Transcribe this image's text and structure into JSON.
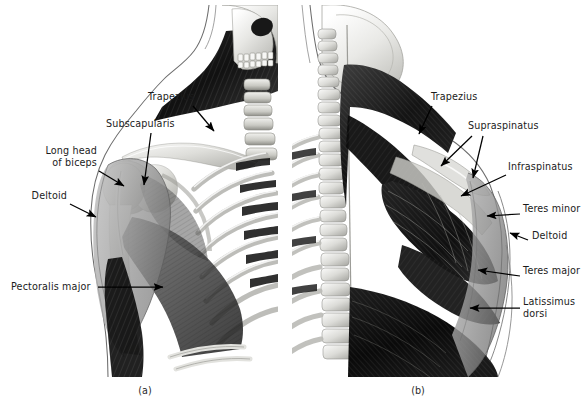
{
  "figure": {
    "background": "#ffffff",
    "text_color": "#1b1b1b",
    "leader_color": "#000000"
  },
  "panels": [
    {
      "id": "a",
      "caption": "(a)",
      "view": "anterior",
      "labels": [
        {
          "name": "trapezius",
          "text": "Trapezius",
          "lines": [
            "Trapezius"
          ],
          "align": "left",
          "x": 148,
          "y": 96
        },
        {
          "name": "subscapularis",
          "text": "Subscapularis",
          "lines": [
            "Subscapularis"
          ],
          "align": "left",
          "x": 106,
          "y": 123
        },
        {
          "name": "long-head-biceps",
          "text": "Long head of biceps",
          "lines": [
            "Long head",
            "of biceps"
          ],
          "align": "right",
          "x": 96,
          "y": 149
        },
        {
          "name": "deltoid",
          "text": "Deltoid",
          "lines": [
            "Deltoid"
          ],
          "align": "right",
          "x": 62,
          "y": 194
        },
        {
          "name": "pectoralis-major",
          "text": "Pectoralis major",
          "lines": [
            "Pectoralis major"
          ],
          "align": "left",
          "x": 11,
          "y": 281
        }
      ]
    },
    {
      "id": "b",
      "caption": "(b)",
      "view": "posterior",
      "labels": [
        {
          "name": "trapezius",
          "text": "Trapezius",
          "lines": [
            "Trapezius"
          ],
          "align": "left",
          "x": 432,
          "y": 96
        },
        {
          "name": "supraspinatus",
          "text": "Supraspinatus",
          "lines": [
            "Supraspinatus"
          ],
          "align": "left",
          "x": 469,
          "y": 124
        },
        {
          "name": "infraspinatus",
          "text": "Infraspinatus",
          "lines": [
            "Infraspinatus"
          ],
          "align": "left",
          "x": 509,
          "y": 166
        },
        {
          "name": "teres-minor",
          "text": "Teres minor",
          "lines": [
            "Teres minor"
          ],
          "align": "left",
          "x": 524,
          "y": 208
        },
        {
          "name": "deltoid",
          "text": "Deltoid",
          "lines": [
            "Deltoid"
          ],
          "align": "left",
          "x": 532,
          "y": 235
        },
        {
          "name": "teres-major",
          "text": "Teres major",
          "lines": [
            "Teres major"
          ],
          "align": "left",
          "x": 524,
          "y": 269
        },
        {
          "name": "latissimus-dorsi",
          "text": "Latissimus dorsi",
          "lines": [
            "Latissimus",
            "dorsi"
          ],
          "align": "left",
          "x": 524,
          "y": 300
        }
      ]
    }
  ],
  "captions": {
    "a": "(a)",
    "b": "(b)"
  },
  "label_text": {
    "trapezius_a": "Trapezius",
    "subscapularis": "Subscapularis",
    "long_head_1": "Long head",
    "long_head_2": "of biceps",
    "deltoid_a": "Deltoid",
    "pectoralis_major": "Pectoralis major",
    "trapezius_b": "Trapezius",
    "supraspinatus": "Supraspinatus",
    "infraspinatus": "Infraspinatus",
    "teres_minor": "Teres minor",
    "deltoid_b": "Deltoid",
    "teres_major": "Teres major",
    "latissimus_1": "Latissimus",
    "latissimus_2": "dorsi"
  }
}
